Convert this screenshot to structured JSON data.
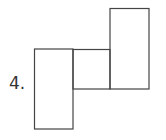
{
  "figure": {
    "label": "4.",
    "stroke_color": "#444444",
    "shapes": [
      {
        "name": "left-rectangle",
        "x": 34,
        "y": 49,
        "width": 39,
        "height": 80
      },
      {
        "name": "middle-square",
        "x": 73,
        "y": 49,
        "width": 37,
        "height": 40
      },
      {
        "name": "right-rectangle",
        "x": 110,
        "y": 8,
        "width": 39,
        "height": 81
      }
    ]
  }
}
